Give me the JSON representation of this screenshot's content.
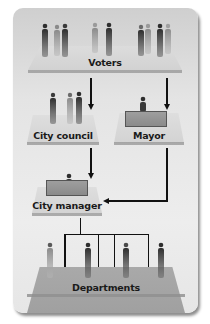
{
  "diagram": {
    "type": "council-manager government structure",
    "nodes": [
      {
        "id": "voters",
        "label": "Voters"
      },
      {
        "id": "city_council",
        "label": "City council"
      },
      {
        "id": "mayor",
        "label": "Mayor"
      },
      {
        "id": "city_manager",
        "label": "City manager"
      },
      {
        "id": "departments",
        "label": "Departments"
      }
    ],
    "edges": [
      {
        "from": "voters",
        "to": "city_council"
      },
      {
        "from": "voters",
        "to": "mayor"
      },
      {
        "from": "city_council",
        "to": "city_manager"
      },
      {
        "from": "mayor",
        "to": "city_manager"
      },
      {
        "from": "city_manager",
        "to": "departments",
        "branches": 4
      }
    ],
    "colors": {
      "panel": "#e6e6e6",
      "platform_light": "#d9d9d9",
      "platform_dark": "#a8a8a8",
      "desk": "#909090",
      "lines": "#111111"
    }
  }
}
